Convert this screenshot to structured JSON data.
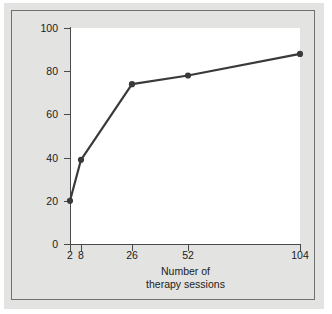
{
  "figure": {
    "background_color": "#e3e3e1",
    "plot_background_color": "#ffffff",
    "frame_color": "#707070"
  },
  "chart_data": {
    "type": "line",
    "title": "",
    "subtitle": "",
    "xlabel_line1": "Number of",
    "xlabel_line2": "therapy sessions",
    "ylabel": "Percent of patients improved",
    "x": [
      2,
      8,
      26,
      52,
      104
    ],
    "values": [
      20,
      39,
      74,
      78,
      88
    ],
    "categories": [
      "2",
      "8",
      "26",
      "52",
      "104"
    ],
    "xtick_labels": [
      "2",
      "8",
      "26",
      "52",
      "104"
    ],
    "ytick_labels": [
      "0",
      "20",
      "40",
      "60",
      "80",
      "100"
    ],
    "yticks": [
      0,
      20,
      40,
      60,
      80,
      100
    ],
    "ylim": [
      0,
      100
    ],
    "xlim": [
      0,
      110
    ],
    "grid": false,
    "legend": false,
    "legend_position": "none",
    "series": [
      {
        "name": "Percent of patients improved",
        "values": [
          20,
          39,
          74,
          78,
          88
        ],
        "color": "#3a3a3a",
        "marker": "circle",
        "line_width": 2.2
      }
    ],
    "annotations": []
  },
  "icons": {
    "marker": "filled-circle-marker"
  }
}
